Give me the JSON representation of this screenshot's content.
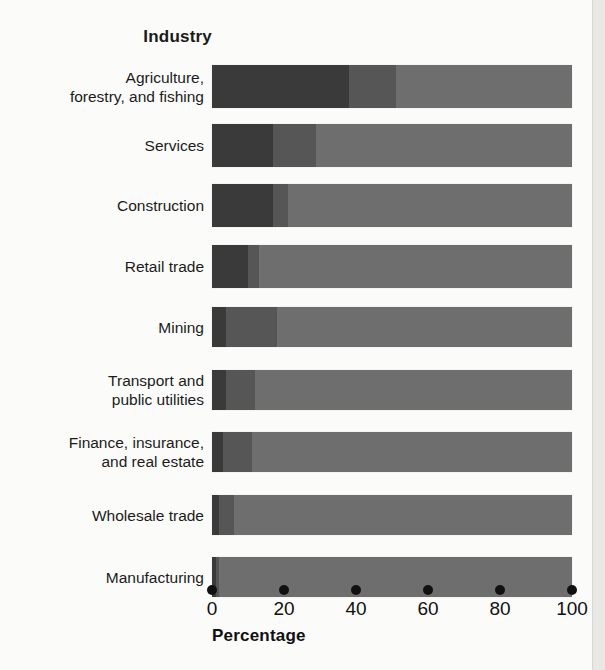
{
  "chart_data": {
    "type": "bar",
    "orientation": "horizontal",
    "stacked": true,
    "normalized": true,
    "title": "",
    "xlabel": "Percentage",
    "ylabel": "Industry",
    "xlim": [
      0,
      100
    ],
    "xticks": [
      0,
      20,
      40,
      60,
      80,
      100
    ],
    "xtick_labels": [
      "0",
      "20",
      "40",
      "60",
      "80",
      "100"
    ],
    "grid": false,
    "legend": "none",
    "categories": [
      "Agriculture, forestry, and fishing",
      "Services",
      "Construction",
      "Retail trade",
      "Mining",
      "Transport and public utilities",
      "Finance, insurance, and real estate",
      "Wholesale trade",
      "Manufacturing"
    ],
    "category_lines": [
      [
        "Agriculture,",
        "forestry, and fishing"
      ],
      [
        "Services"
      ],
      [
        "Construction"
      ],
      [
        "Retail trade"
      ],
      [
        "Mining"
      ],
      [
        "Transport and",
        "public utilities"
      ],
      [
        "Finance, insurance,",
        "and real estate"
      ],
      [
        "Wholesale trade"
      ],
      [
        "Manufacturing"
      ]
    ],
    "series": [
      {
        "name": "segment-1",
        "color": "#3a3a3a",
        "values": [
          38,
          17,
          17,
          10,
          4,
          4,
          3,
          2,
          1
        ]
      },
      {
        "name": "segment-2",
        "color": "#565656",
        "values": [
          13,
          12,
          4,
          3,
          14,
          8,
          8,
          4,
          1
        ]
      },
      {
        "name": "segment-3",
        "color": "#6e6e6e",
        "values": [
          49,
          71,
          79,
          87,
          82,
          88,
          89,
          94,
          98
        ]
      }
    ]
  },
  "colors": {
    "background": "#fbfbf9",
    "text": "#1b1b1b",
    "tick": "#111111",
    "segment_dark": "#3a3a3a",
    "segment_mid": "#565656",
    "segment_light": "#6e6e6e"
  }
}
